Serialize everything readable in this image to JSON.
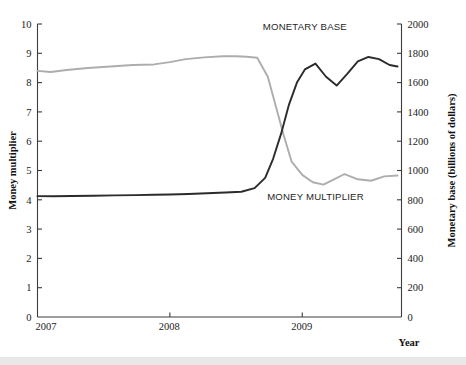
{
  "figure": {
    "background": "#ffffff",
    "left_axis_title": "Money multiplier",
    "right_axis_title": "Monetary base (billions of dollars)",
    "x_axis_title": "Year",
    "series_label_base": "MONETARY BASE",
    "series_label_multiplier": "MONEY MULTIPLIER",
    "color_base": "#2b2b2b",
    "color_multiplier": "#adadad"
  },
  "chart_data": {
    "type": "line",
    "title": "",
    "subtitle": "",
    "xlabel": "Year",
    "ylabel": "Money multiplier",
    "y2label": "Monetary base (billions of dollars)",
    "grid": false,
    "legend_position": "inline-annotation",
    "xlim": [
      2007.0,
      2009.75
    ],
    "xtick_labels": [
      "2007",
      "2008",
      "2009"
    ],
    "xtick_values": [
      2007,
      2008,
      2009
    ],
    "ylim": [
      0,
      10
    ],
    "ytick_labels": [
      "0",
      "1",
      "2",
      "3",
      "4",
      "5",
      "6",
      "7",
      "8",
      "9",
      "10"
    ],
    "ytick_values": [
      0,
      1,
      2,
      3,
      4,
      5,
      6,
      7,
      8,
      9,
      10
    ],
    "y2lim": [
      0,
      2000
    ],
    "y2tick_labels": [
      "0",
      "200",
      "400",
      "600",
      "800",
      "1000",
      "1200",
      "1400",
      "1600",
      "1800",
      "2000"
    ],
    "y2tick_values": [
      0,
      200,
      400,
      600,
      800,
      1000,
      1200,
      1400,
      1600,
      1800,
      2000
    ],
    "series": [
      {
        "name": "MONEY MULTIPLIER",
        "axis": "left",
        "color": "#adadad",
        "x": [
          2007.0,
          2007.1,
          2007.22,
          2007.38,
          2007.55,
          2007.72,
          2007.88,
          2008.0,
          2008.12,
          2008.26,
          2008.4,
          2008.5,
          2008.58,
          2008.66,
          2008.74,
          2008.8,
          2008.86,
          2008.92,
          2009.0,
          2009.08,
          2009.16,
          2009.24,
          2009.32,
          2009.42,
          2009.52,
          2009.62,
          2009.72
        ],
        "y": [
          8.4,
          8.36,
          8.43,
          8.5,
          8.55,
          8.6,
          8.62,
          8.7,
          8.8,
          8.86,
          8.9,
          8.9,
          8.88,
          8.85,
          8.2,
          7.2,
          6.2,
          5.3,
          4.85,
          4.6,
          4.52,
          4.7,
          4.88,
          4.7,
          4.65,
          4.8,
          4.83
        ]
      },
      {
        "name": "MONETARY BASE",
        "axis": "right",
        "color": "#2b2b2b",
        "x": [
          2007.0,
          2007.12,
          2007.26,
          2007.42,
          2007.58,
          2007.74,
          2007.88,
          2008.0,
          2008.14,
          2008.28,
          2008.42,
          2008.54,
          2008.64,
          2008.72,
          2008.78,
          2008.84,
          2008.9,
          2008.96,
          2009.02,
          2009.1,
          2009.18,
          2009.26,
          2009.34,
          2009.42,
          2009.5,
          2009.58,
          2009.66,
          2009.72
        ],
        "y": [
          825,
          824,
          826,
          828,
          830,
          832,
          834,
          836,
          840,
          845,
          850,
          855,
          880,
          950,
          1080,
          1250,
          1450,
          1600,
          1690,
          1730,
          1640,
          1580,
          1660,
          1745,
          1775,
          1760,
          1720,
          1710
        ]
      }
    ],
    "annotations": [
      {
        "text": "MONETARY BASE",
        "x": 2009.02,
        "y_right": 1960
      },
      {
        "text": "MONEY MULTIPLIER",
        "x": 2009.1,
        "y_left": 4.0
      }
    ]
  }
}
